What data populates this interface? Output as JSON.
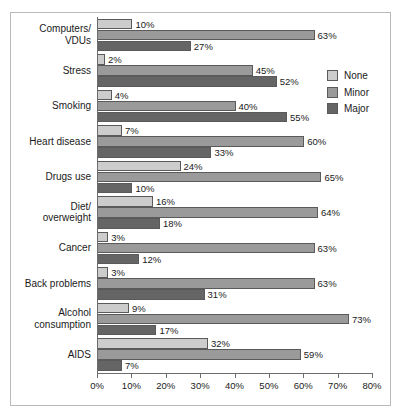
{
  "chart_data": {
    "type": "bar",
    "title": "",
    "subtitle": "",
    "xlabel": "",
    "ylabel": "",
    "orientation": "horizontal",
    "grouped": true,
    "grid": false,
    "legend_position": "right",
    "xlim": [
      0,
      80
    ],
    "xtick_labels": [
      "0%",
      "10%",
      "20%",
      "30%",
      "40%",
      "50%",
      "60%",
      "70%",
      "80%"
    ],
    "xticks": [
      0,
      10,
      20,
      30,
      40,
      50,
      60,
      70,
      80
    ],
    "value_suffix": "%",
    "categories": [
      "Computers/\nVDUs",
      "Stress",
      "Smoking",
      "Heart disease",
      "Drugs use",
      "Diet/\noverweight",
      "Cancer",
      "Back problems",
      "Alcohol\nconsumption",
      "AIDS"
    ],
    "legend": [
      "None",
      "Minor",
      "Major"
    ],
    "series": [
      {
        "name": "None",
        "color": "#cccccc",
        "values": [
          10,
          2,
          4,
          7,
          24,
          16,
          3,
          3,
          9,
          32
        ]
      },
      {
        "name": "Minor",
        "color": "#9a9a9a",
        "values": [
          63,
          45,
          40,
          60,
          65,
          64,
          63,
          63,
          73,
          59
        ]
      },
      {
        "name": "Major",
        "color": "#656565",
        "values": [
          27,
          52,
          55,
          33,
          10,
          18,
          12,
          31,
          17,
          7
        ]
      }
    ],
    "data_labels": [
      {
        "category": "Computers/VDUs",
        "None": "10%",
        "Minor": "63%",
        "Major": "27%"
      },
      {
        "category": "Stress",
        "None": "2%",
        "Minor": "45%",
        "Major": "52%"
      },
      {
        "category": "Smoking",
        "None": "4%",
        "Minor": "40%",
        "Major": "55%"
      },
      {
        "category": "Heart disease",
        "None": "7%",
        "Minor": "60%",
        "Major": "33%"
      },
      {
        "category": "Drugs use",
        "None": "24%",
        "Minor": "65%",
        "Major": "10%"
      },
      {
        "category": "Diet/overweight",
        "None": "16%",
        "Minor": "64%",
        "Major": "18%"
      },
      {
        "category": "Cancer",
        "None": "3%",
        "Minor": "63%",
        "Major": "12%"
      },
      {
        "category": "Back problems",
        "None": "3%",
        "Minor": "63%",
        "Major": "31%"
      },
      {
        "category": "Alcohol consumption",
        "None": "9%",
        "Minor": "73%",
        "Major": "17%"
      },
      {
        "category": "AIDS",
        "None": "32%",
        "Minor": "59%",
        "Major": "7%"
      }
    ]
  },
  "colors": {
    "none": "#cccccc",
    "minor": "#9a9a9a",
    "major": "#656565",
    "axis": "#6d6d6d",
    "bar_outline": "#5a5a5a",
    "frame": "#b9b9b9",
    "text": "#1a1a1a",
    "background": "#ffffff"
  }
}
